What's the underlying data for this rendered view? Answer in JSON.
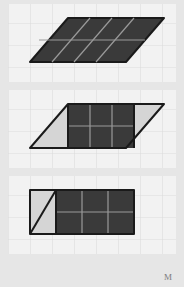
{
  "canvas": {
    "width": 184,
    "height": 287,
    "background_color": "#e6e6e6",
    "panel_background_color": "#f2f2f2"
  },
  "style": {
    "grid_line_color": "#dcdcdc",
    "grid_line_color_major": "#d2d2d2",
    "grid_cell_size": 22,
    "dark_fill": "#3a3a3a",
    "light_fill": "#d5d5d5",
    "outline_color": "#1a1a1a",
    "inner_grid_on_dark": "#9a9a9a",
    "outline_width": 2
  },
  "watermark": {
    "name": "corner-watermark",
    "text": "M"
  },
  "figures": [
    {
      "id": "figure-1-parallelogram",
      "panel_index": 0,
      "caption": "Whole parallelogram shaded dark",
      "shape": "parallelogram",
      "base_cells": 3,
      "height_cells": 2,
      "slant_cells": 2,
      "fill": "dark",
      "points": "60,14 156,14 118,58 22,58",
      "internal_lines": [
        "44,58 82,14",
        "66,58 104,14",
        "88,58 126,14",
        "31,36 137,36"
      ],
      "light_regions": []
    },
    {
      "id": "figure-2-parallelogram-split",
      "panel_index": 1,
      "caption": "Parallelogram split: left triangle, middle rectangle, right triangle",
      "shape": "parallelogram-decomposed",
      "base_cells": 3,
      "height_cells": 2,
      "slant_cells": 2,
      "fill": "mixed",
      "points": "60,14 156,14 118,58 22,58",
      "dark_region": "60,14 126,14 126,58 60,58",
      "light_regions": [
        "60,14 60,58 22,58",
        "126,14 156,14 118,58 126,58"
      ],
      "internal_lines": [
        "82,14 82,58",
        "104,14 104,58",
        "60,36 126,36"
      ],
      "cut_lines": [
        "60,14 60,58",
        "126,14 126,58"
      ]
    },
    {
      "id": "figure-3-rectangle",
      "panel_index": 2,
      "caption": "Rearranged into rectangle with triangle moved to left square",
      "shape": "rectangle",
      "base_cells": 4,
      "height_cells": 2,
      "fill": "mixed",
      "points": "22,14 126,14 126,58 22,58",
      "dark_region": "48,14 126,14 126,58 48,58",
      "light_regions": [
        "22,14 48,14 48,58 22,58"
      ],
      "internal_lines": [
        "74,14 74,58",
        "100,14 100,58",
        "48,36 126,36"
      ],
      "diagonal_lines": [
        "22,58 48,14"
      ],
      "cut_lines": [
        "48,14 48,58"
      ]
    }
  ]
}
